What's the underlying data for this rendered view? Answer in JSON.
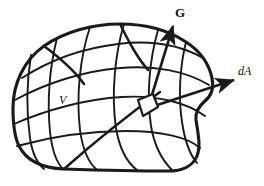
{
  "figure": {
    "background_color": "#ffffff",
    "ink_color": "#1a1a1a",
    "labels": {
      "volume": "V",
      "area_element": "dA",
      "vector_field": "G"
    },
    "label_styles": {
      "volume": "italic-serif",
      "area_element": "italic-serif",
      "vector_field": "bold-serif"
    },
    "icons": {
      "vector_field_arrow": "arrow-up-right-icon",
      "area_element_arrow": "arrow-right-icon",
      "surface_patch": "parallelogram-patch-icon",
      "blob": "closed-surface-blob-icon",
      "mesh": "curvilinear-grid-icon"
    },
    "geometry": {
      "blob_outline": "M 13,108 C 13,84 24,60 44,46 C 64,32 92,24 120,24 C 146,24 168,30 186,42 C 200,51 209,64 212,78 C 214,88 211,96 205,101 C 199,106 195,112 196,120 C 198,133 201,146 197,156 C 193,166 182,171 168,171 C 140,171 96,170 64,169 C 42,168 26,160 19,146 C 14,136 13,122 13,108 Z",
      "mesh_meridians": [
        "M 31,55 C 27,80 26,110 30,138 C 32,152 37,163 44,169",
        "M 57,38 C 50,66 47,100 50,132 C 52,150 57,163 63,169",
        "M 90,27 C 80,57 76,96 80,130 C 83,152 90,164 97,170",
        "M 124,24 C 115,54 111,94 116,128 C 120,152 129,164 137,170",
        "M 158,30 C 150,58 146,94 151,126 C 155,150 164,162 172,170",
        "M 186,42 C 180,66 178,96 182,122 C 185,142 191,156 197,163"
      ],
      "mesh_parallels": [
        "M 22,78 C 50,60 84,48 118,44 C 150,40 180,45 203,58",
        "M 15,100 C 46,83 84,71 120,68 C 154,65 186,71 209,85",
        "M 14,124 C 46,110 86,99 122,97 C 156,95 186,102 205,116",
        "M 17,146 C 50,137 90,131 126,131 C 160,131 188,137 200,148"
      ],
      "mesh_extra": [
        "M 44,46 C 60,58 74,70 84,84",
        "M 120,24 C 128,40 136,56 148,70",
        "M 64,169 C 90,146 124,118 160,92"
      ],
      "vector_G": {
        "x1": 148,
        "y1": 108,
        "x2": 173,
        "y2": 24
      },
      "vector_dA": {
        "x1": 148,
        "y1": 108,
        "x2": 236,
        "y2": 80
      },
      "patch": "M 138,100 L 153,94 L 158,107 L 143,116 Z"
    }
  }
}
